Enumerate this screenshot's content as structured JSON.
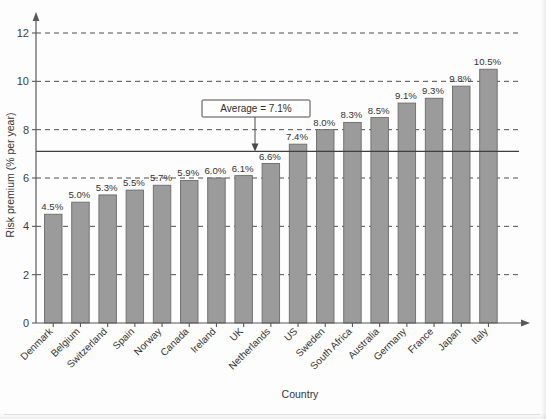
{
  "chart_data": {
    "type": "bar",
    "title": "",
    "xlabel": "Country",
    "ylabel": "Risk premium (% per year)",
    "ylim": [
      0,
      12
    ],
    "yticks": [
      0,
      2,
      4,
      6,
      8,
      10,
      12
    ],
    "ytick_labels": [
      "0",
      "2",
      "4",
      "6",
      "8",
      "10",
      "12"
    ],
    "grid": "horizontal-dashed-at-6-8-10-12",
    "legend": "none",
    "categories": [
      "Denmark",
      "Belgium",
      "Switzerland",
      "Spain",
      "Norway",
      "Canada",
      "Ireland",
      "UK",
      "Netherlands",
      "US",
      "Sweden",
      "South Africa",
      "Australia",
      "Germany",
      "France",
      "Japan",
      "Italy"
    ],
    "values": [
      4.5,
      5.0,
      5.3,
      5.5,
      5.7,
      5.9,
      6.0,
      6.1,
      6.6,
      7.4,
      8.0,
      8.3,
      8.5,
      9.1,
      9.3,
      9.8,
      10.5
    ],
    "data_labels": [
      "4.5%",
      "5.0%",
      "5.3%",
      "5.5%",
      "5.7%",
      "5.9%",
      "6.0%",
      "6.1%",
      "6.6%",
      "7.4%",
      "8.0%",
      "8.3%",
      "8.5%",
      "9.1%",
      "9.3%",
      "9.8%",
      "10.5%"
    ],
    "annotations": [
      {
        "name": "average-callout",
        "text": "Average = 7.1%",
        "value": 7.1,
        "kind": "reference-line-with-box-and-arrow"
      }
    ],
    "colors": {
      "bar_fill": "#9b9b9b",
      "bar_stroke": "#6c6c6c",
      "axis": "#58595b",
      "grid": "#4f4f4f",
      "text": "#343434",
      "background": "#fdfdfd"
    }
  },
  "annotation": {
    "average_label": "Average = 7.1%"
  },
  "axes": {
    "y_title": "Risk premium (% per year)",
    "x_title": "Country"
  }
}
